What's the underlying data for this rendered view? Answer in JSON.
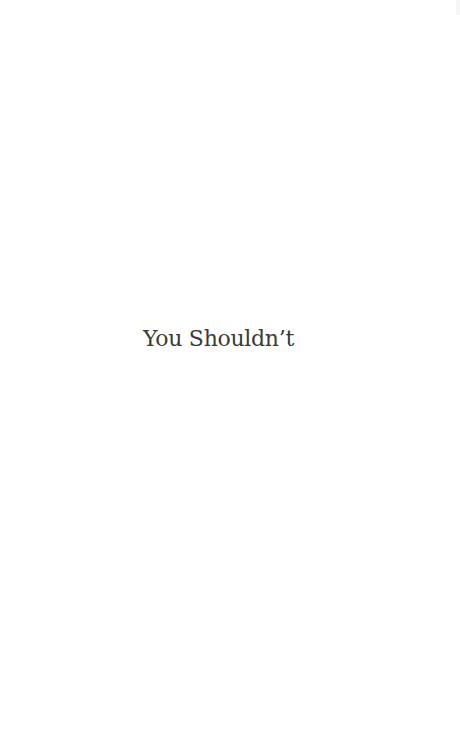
{
  "page": {
    "title": "You Shouldn’t",
    "background_color": "#ffffff",
    "text_color": "#3a3a3a"
  }
}
